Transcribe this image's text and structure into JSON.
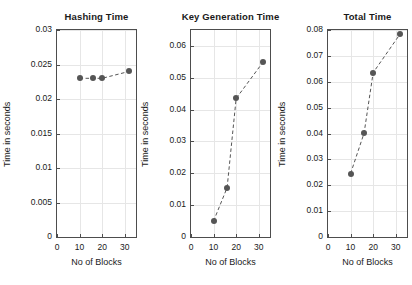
{
  "figure": {
    "background_color": "#ffffff",
    "marker_color": "#555555",
    "line_color": "#555555",
    "grid_color": "#e6e6e6",
    "axis_color": "#4d4d4d",
    "text_color": "#1a1a1a"
  },
  "chart_data": [
    {
      "type": "line",
      "title": "Hashing Time",
      "xlabel": "No of Blocks",
      "ylabel": "Time in seconds",
      "x": [
        10,
        16,
        20,
        32
      ],
      "values": [
        0.023,
        0.023,
        0.023,
        0.024
      ],
      "xlim": [
        0,
        35
      ],
      "ylim": [
        0,
        0.03
      ],
      "xticks": [
        0,
        10,
        20,
        30
      ],
      "xticklabels": [
        "0",
        "10",
        "20",
        "30"
      ],
      "yticks": [
        0,
        0.005,
        0.01,
        0.015,
        0.02,
        0.025,
        0.03
      ],
      "yticklabels": [
        "0",
        "0.005",
        "0.01",
        "0.015",
        "0.02",
        "0.025",
        "0.03"
      ],
      "grid": true,
      "legend": null,
      "linestyle": "dashed",
      "marker": "filled-circle"
    },
    {
      "type": "line",
      "title": "Key Generation Time",
      "xlabel": "No of Blocks",
      "ylabel": "Time in seconds",
      "x": [
        10,
        16,
        20,
        32
      ],
      "values": [
        0.005,
        0.0155,
        0.0435,
        0.055
      ],
      "xlim": [
        0,
        35
      ],
      "ylim": [
        0,
        0.065
      ],
      "xticks": [
        0,
        10,
        20,
        30
      ],
      "xticklabels": [
        "0",
        "10",
        "20",
        "30"
      ],
      "yticks": [
        0,
        0.01,
        0.02,
        0.03,
        0.04,
        0.05,
        0.06
      ],
      "yticklabels": [
        "0",
        "0.01",
        "0.02",
        "0.03",
        "0.04",
        "0.05",
        "0.06"
      ],
      "grid": true,
      "legend": null,
      "linestyle": "dashed",
      "marker": "filled-circle"
    },
    {
      "type": "line",
      "title": "Total Time",
      "xlabel": "No of Blocks",
      "ylabel": "Time in seconds",
      "x": [
        10,
        16,
        20,
        32
      ],
      "values": [
        0.0245,
        0.0402,
        0.0635,
        0.0785
      ],
      "xlim": [
        0,
        35
      ],
      "ylim": [
        0,
        0.08
      ],
      "xticks": [
        0,
        10,
        20,
        30
      ],
      "xticklabels": [
        "0",
        "10",
        "20",
        "30"
      ],
      "yticks": [
        0,
        0.01,
        0.02,
        0.03,
        0.04,
        0.05,
        0.06,
        0.07,
        0.08
      ],
      "yticklabels": [
        "0",
        "0.01",
        "0.02",
        "0.03",
        "0.04",
        "0.05",
        "0.06",
        "0.07",
        "0.08"
      ],
      "grid": true,
      "legend": null,
      "linestyle": "dashed",
      "marker": "filled-circle"
    }
  ]
}
